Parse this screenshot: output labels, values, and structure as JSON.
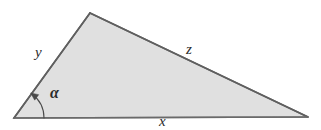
{
  "figure": {
    "name": "triangle-diagram",
    "background_color": "#ffffff"
  },
  "shape": {
    "kind": "triangle",
    "fill_color": "#e0e0e0",
    "stroke_color": "#6b6b6b",
    "stroke_width": 1.6,
    "vertices": {
      "bottom_left": {
        "x": 14,
        "y": 118
      },
      "apex": {
        "x": 90,
        "y": 13
      },
      "bottom_right": {
        "x": 308,
        "y": 117
      }
    }
  },
  "labels": {
    "side_y": "y",
    "side_z": "z",
    "side_x": "x",
    "angle_alpha": "α"
  },
  "angle_marker": {
    "name": "alpha-arc",
    "stroke_color": "#4a4a4a",
    "stroke_width": 1.1,
    "radius": 30,
    "arrowhead": true
  },
  "chart_data": {
    "type": "diagram",
    "title": "",
    "annotations": [
      "y",
      "z",
      "x",
      "α"
    ]
  }
}
